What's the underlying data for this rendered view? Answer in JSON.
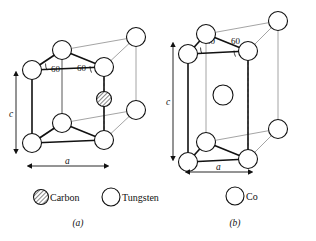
{
  "figure": {
    "background_color": "#ffffff",
    "line_color_front": "#111111",
    "line_color_back": "#9a9a9a",
    "dash_color": "#a8a8a8"
  },
  "panel_a": {
    "caption": "(a)",
    "angles": [
      {
        "label": "60"
      },
      {
        "label": "60"
      }
    ],
    "dimensions": {
      "vertical_label": "c",
      "horizontal_label": "a"
    },
    "legend": [
      {
        "name": "Carbon",
        "symbol": "hatched-circle"
      },
      {
        "name": "Tungsten",
        "symbol": "open-circle"
      }
    ],
    "atom_counts": {
      "tungsten_corners": 8,
      "carbon_interior": 1
    }
  },
  "panel_b": {
    "caption": "(b)",
    "angles": [
      {
        "label": "60"
      },
      {
        "label": "60"
      }
    ],
    "dimensions": {
      "vertical_label": "c",
      "horizontal_label": "a"
    },
    "legend": [
      {
        "name": "Co",
        "symbol": "open-circle"
      }
    ],
    "atom_counts": {
      "cobalt_corners": 8,
      "cobalt_interior": 1
    }
  }
}
